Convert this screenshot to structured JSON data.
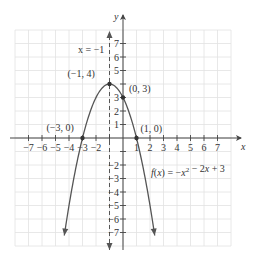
{
  "chart_data": {
    "type": "line",
    "title": "",
    "function": "f(x) = -x^2 - 2x + 3",
    "equation_label": "f(x) = −x² − 2x + 3",
    "xlabel": "x",
    "ylabel": "y",
    "xlim": [
      -8,
      8
    ],
    "ylim": [
      -8,
      8
    ],
    "grid": true,
    "x_ticks": [
      -7,
      -6,
      -5,
      -4,
      -3,
      -2,
      1,
      2,
      3,
      4,
      5,
      6,
      7
    ],
    "x_tick_labels": [
      "−7",
      "−6",
      "−5",
      "−4",
      "−3",
      "−2",
      "1",
      "2",
      "3",
      "4",
      "5",
      "6",
      "7"
    ],
    "y_ticks": [
      7,
      6,
      5,
      3,
      2,
      1,
      -2,
      -3,
      -4,
      -5,
      -6,
      -7
    ],
    "y_tick_labels": [
      "7",
      "6",
      "5",
      "3",
      "2",
      "1",
      "−2",
      "−3",
      "−4",
      "−5",
      "−6",
      "−7"
    ],
    "axis_of_symmetry": {
      "x": -1,
      "label": "x = −1",
      "style": "dashed"
    },
    "labeled_points": [
      {
        "x": -1,
        "y": 4,
        "label": "(−1, 4)",
        "role": "vertex"
      },
      {
        "x": 0,
        "y": 3,
        "label": "(0, 3)",
        "role": "y-intercept"
      },
      {
        "x": -3,
        "y": 0,
        "label": "(−3, 0)",
        "role": "x-intercept"
      },
      {
        "x": 1,
        "y": 0,
        "label": "(1, 0)",
        "role": "x-intercept"
      }
    ],
    "series": [
      {
        "name": "f(x) = -x^2 - 2x + 3",
        "x": [
          -4.4,
          -4,
          -3.5,
          -3,
          -2.5,
          -2,
          -1.5,
          -1,
          -0.5,
          0,
          0.5,
          1,
          1.5,
          2,
          2.4
        ],
        "y": [
          -8.56,
          -5,
          -1.75,
          0,
          1.75,
          3,
          3.75,
          4,
          3.75,
          3,
          1.75,
          0,
          -1.75,
          -5,
          -8.56
        ]
      }
    ]
  }
}
